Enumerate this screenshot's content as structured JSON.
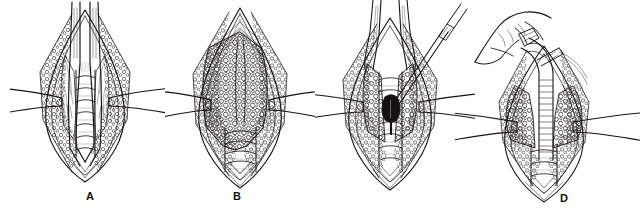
{
  "figure": {
    "medium": "pen-and-ink line drawing",
    "style": "black and white cross-hatched medical illustration",
    "background_color": "#fefefd",
    "ink_color": "#15120f",
    "panel_count": 4,
    "caption_font_weight": "bold"
  },
  "panels": [
    {
      "id": "panel-a",
      "label": "A",
      "label_visible": true,
      "label_x": 86,
      "label_y": 196,
      "x": 10,
      "width": 155,
      "description": "Vertical midline neck incision held open by retractors; strap muscles separated in the midline exposing the anterior tracheal rings below the thyroid isthmus.",
      "features": [
        "skin edges with subcutaneous fat stippling",
        "paired vertical strap muscles retracted laterally",
        "two horizontal retractor blades",
        "exposed cartilaginous tracheal rings"
      ]
    },
    {
      "id": "panel-b",
      "label": "B",
      "label_visible": true,
      "label_x": 233,
      "label_y": 196,
      "x": 165,
      "width": 150,
      "description": "Thyroid isthmus and lobes visible overlying the upper trachea within the open wound; lower tracheal rings exposed inferiorly.",
      "features": [
        "nodular thyroid gland tissue",
        "thyroid isthmus crossing the trachea",
        "tracheal rings below the isthmus",
        "retractor blades holding the wound open"
      ]
    },
    {
      "id": "panel-c",
      "label": "C",
      "label_visible": false,
      "label_x": 390,
      "label_y": 196,
      "x": 315,
      "width": 160,
      "description": "Vertical incision made into the trachea with a scalpel, creating a dark stoma opening in the anterior tracheal wall.",
      "features": [
        "scalpel held at an oblique angle from upper right",
        "dark tracheal stoma opening",
        "vertical tracheal incision through the rings",
        "thyroid tissue retracted to either side"
      ]
    },
    {
      "id": "panel-d",
      "label": "D",
      "label_visible": true,
      "label_x": 560,
      "label_y": 198,
      "x": 455,
      "width": 180,
      "description": "Surgeon's hand introducing the curved tracheostomy tube with its neck flange through the stoma into the tracheal lumen.",
      "features": [
        "gloved hand gripping the tube",
        "tracheostomy tube with ribbed shaft",
        "tube neck flange",
        "tube entering the tracheal stoma"
      ]
    }
  ]
}
